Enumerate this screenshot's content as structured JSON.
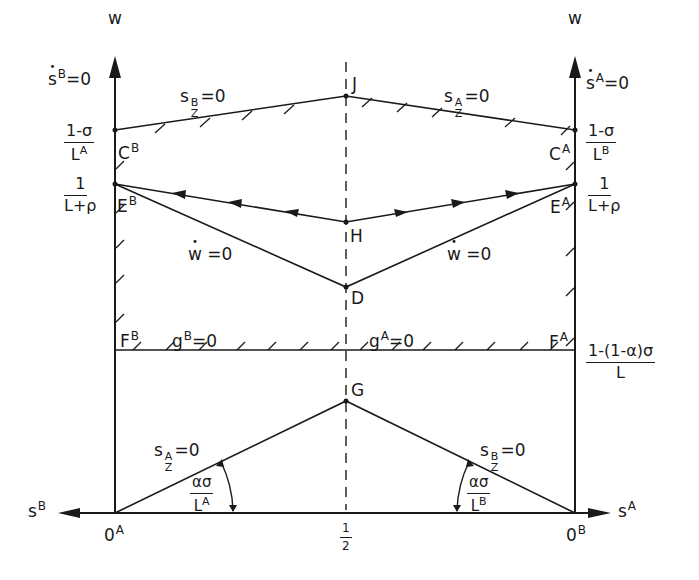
{
  "axes": {
    "left_vertical_label": "w",
    "right_vertical_label": "w",
    "left_horizontal_label": "s",
    "left_horizontal_sup": "B",
    "right_horizontal_label": "s",
    "right_horizontal_sup": "A",
    "midpoint_num": "1",
    "midpoint_den": "2"
  },
  "origins": {
    "left": {
      "base": "0",
      "sup": "A"
    },
    "right": {
      "base": "0",
      "sup": "B"
    }
  },
  "axis_conditions": {
    "left": {
      "base": "s",
      "sup": "B",
      "rest": "=0"
    },
    "right": {
      "base": "s",
      "sup": "A",
      "rest": "=0"
    }
  },
  "left_ticks": [
    {
      "num": "1-σ",
      "den": "L",
      "den_sup": "A"
    },
    {
      "num": "1",
      "den": "L",
      "den_rest": "+ρ"
    }
  ],
  "right_ticks": [
    {
      "num": "1-σ",
      "den": "L",
      "den_sup": "B"
    },
    {
      "num": "1",
      "den": "L",
      "den_rest": "+ρ"
    },
    {
      "num": "1-(1-α)σ",
      "den": "L"
    }
  ],
  "points": {
    "J": "J",
    "H": "H",
    "D": "D",
    "G": "G",
    "CB": {
      "base": "C",
      "sup": "B"
    },
    "CA": {
      "base": "C",
      "sup": "A"
    },
    "EB": {
      "base": "E",
      "sup": "B"
    },
    "EA": {
      "base": "E",
      "sup": "A"
    },
    "FB": {
      "base": "F",
      "sup": "B"
    },
    "FA": {
      "base": "F",
      "sup": "A"
    }
  },
  "curves": {
    "upper_left": {
      "base": "s",
      "sup": "B",
      "sub": "Z",
      "rest": "=0"
    },
    "upper_right": {
      "base": "s",
      "sup": "A",
      "sub": "Z",
      "rest": "=0"
    },
    "wdot_left": {
      "base": "w",
      "rest": " =0"
    },
    "wdot_right": {
      "base": "w",
      "rest": " =0"
    },
    "g_left": {
      "base": "g",
      "sup": "B",
      "rest": "=0"
    },
    "g_right": {
      "base": "g",
      "sup": "A",
      "rest": "=0"
    },
    "lower_left": {
      "base": "s",
      "sup": "A",
      "sub": "Z",
      "rest": "=0"
    },
    "lower_right": {
      "base": "s",
      "sup": "B",
      "sub": "Z",
      "rest": "=0"
    }
  },
  "angles": {
    "left": {
      "num": "ασ",
      "den": "L",
      "den_sup": "A"
    },
    "right": {
      "num": "ασ",
      "den": "L",
      "den_sup": "B"
    }
  },
  "colors": {
    "ink": "#1a1a1a",
    "background": "#ffffff"
  }
}
